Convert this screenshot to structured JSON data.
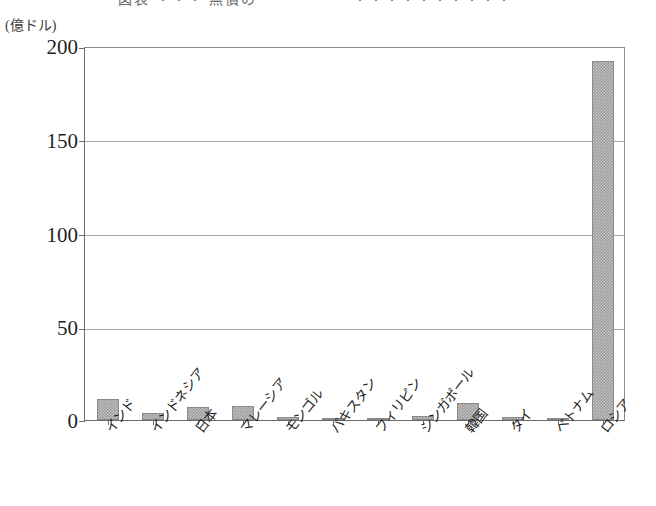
{
  "caption": {
    "top_cut_text": "図表  ・・・ 無償の　　　　　　・・・・・・・・・・"
  },
  "axis": {
    "unit_label": "(億ドル)",
    "y_ticks": [
      0,
      50,
      100,
      150,
      200
    ],
    "y_tick_labels": [
      "0",
      "50",
      "100",
      "150",
      "200"
    ]
  },
  "chart_data": {
    "type": "bar",
    "title": "",
    "subtitle": "",
    "xlabel": "",
    "ylabel": "(億ドル)",
    "ylim": [
      0,
      200
    ],
    "yticks": [
      0,
      50,
      100,
      150,
      200
    ],
    "grid": true,
    "legend": "none",
    "bar_color": "#9d9d9d",
    "categories": [
      "インド",
      "インドネシア",
      "日本",
      "マレーシア",
      "モンゴル",
      "パキスタン",
      "フィリピン",
      "シンガポール",
      "韓国",
      "タイ",
      "ベトナム",
      "ロシア"
    ],
    "values": [
      11,
      4,
      7,
      7.5,
      1.5,
      1,
      1,
      2,
      9,
      1.5,
      1,
      192
    ],
    "series": [
      {
        "name": "金額",
        "values": [
          11,
          4,
          7,
          7.5,
          1.5,
          1,
          1,
          2,
          9,
          1.5,
          1,
          192
        ]
      }
    ]
  }
}
